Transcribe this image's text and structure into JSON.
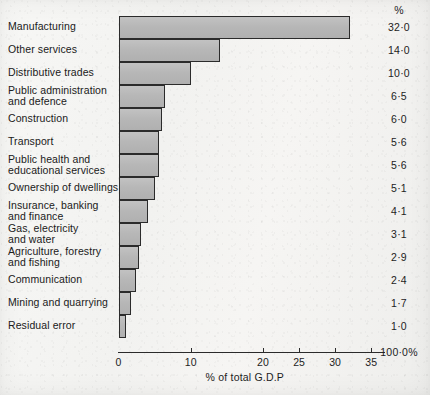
{
  "chart_data": {
    "type": "bar",
    "orientation": "horizontal",
    "title": "",
    "xlabel": "% of total G.D.P",
    "ylabel": "",
    "xlim": [
      0,
      35
    ],
    "grid": false,
    "legend": null,
    "value_column_header": "%",
    "total_label": "100·0%",
    "tick_values": [
      0,
      10,
      20,
      25,
      30,
      35
    ],
    "tick_labels": [
      "0",
      "10",
      "20",
      "25",
      "30",
      "35"
    ],
    "categories": [
      "Manufacturing",
      "Other services",
      "Distributive trades",
      "Public administration and defence",
      "Construction",
      "Transport",
      "Public health and educational services",
      "Ownership of dwellings",
      "Insurance, banking and finance",
      "Gas, electricity and water",
      "Agriculture, forestry and fishing",
      "Communication",
      "Mining and quarrying",
      "Residual error"
    ],
    "values": [
      32.0,
      14.0,
      10.0,
      6.5,
      6.0,
      5.6,
      5.6,
      5.1,
      4.1,
      3.1,
      2.9,
      2.4,
      1.7,
      1.0
    ],
    "value_labels": [
      "32·0",
      "14·0",
      "10·0",
      "6·5",
      "6·0",
      "5·6",
      "5·6",
      "5·1",
      "4·1",
      "3·1",
      "2·9",
      "2·4",
      "1·7",
      "1·0"
    ],
    "category_lines": [
      [
        "Manufacturing"
      ],
      [
        "Other services"
      ],
      [
        "Distributive trades"
      ],
      [
        "Public administration",
        "and defence"
      ],
      [
        "Construction"
      ],
      [
        "Transport"
      ],
      [
        "Public health and",
        "educational services"
      ],
      [
        "Ownership of dwellings"
      ],
      [
        "Insurance, banking",
        "and finance"
      ],
      [
        "Gas, electricity",
        "and water"
      ],
      [
        "Agriculture, forestry",
        "and fishing"
      ],
      [
        "Communication"
      ],
      [
        "Mining and quarrying"
      ],
      [
        "Residual error"
      ]
    ]
  },
  "colors": {
    "bar_fill": "#b7b7b7",
    "bar_outline": "#2b2b2b",
    "text": "#1d1d1d",
    "paper": "#f4f4f2"
  }
}
